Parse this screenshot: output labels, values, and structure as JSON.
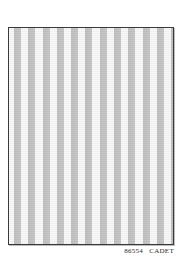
{
  "swatch": {
    "pattern": "vertical-stripes",
    "stripe_count": 12,
    "colors": {
      "ground": "#f6f6f6",
      "stripe": "#c0c0c0",
      "border": "#3a3a3a"
    }
  },
  "caption": {
    "code": "86554",
    "name": "CADET"
  }
}
